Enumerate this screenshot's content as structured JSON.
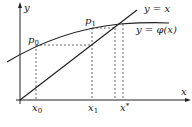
{
  "diagram": {
    "axes": {
      "x_label": "x",
      "y_label": "y"
    },
    "curves": [
      {
        "name": "line",
        "label": "y = x"
      },
      {
        "name": "phi",
        "label": "y = φ(x)"
      }
    ],
    "points": [
      {
        "name": "p0",
        "base": "p",
        "sub": "0"
      },
      {
        "name": "p1",
        "base": "p",
        "sub": "1"
      }
    ],
    "x_ticks": [
      {
        "base": "x",
        "sub": "0"
      },
      {
        "base": "x",
        "sub": "1"
      },
      {
        "base": "x",
        "sup": "*"
      }
    ],
    "colors": {
      "stroke": "#222222",
      "background": "#ffffff"
    }
  }
}
